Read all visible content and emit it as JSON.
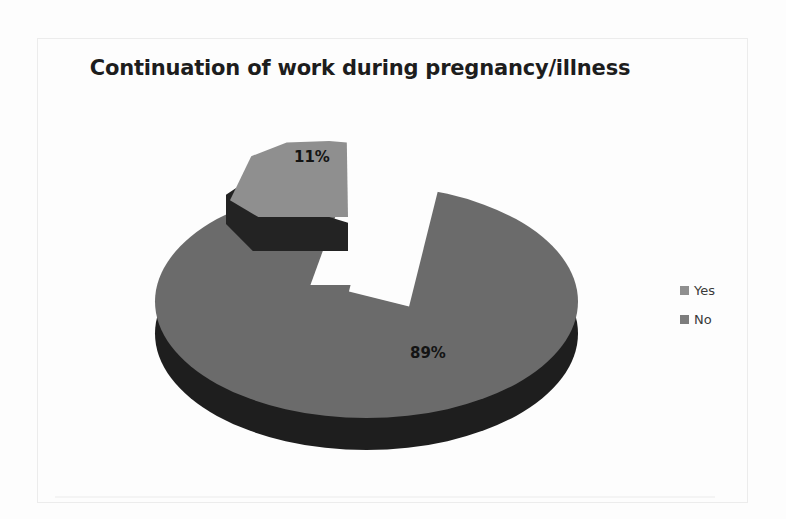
{
  "chart_data": {
    "type": "pie",
    "title": "Continuation of work during pregnancy/illness",
    "categories": [
      "Yes",
      "No"
    ],
    "values": [
      11,
      89
    ],
    "data_labels": [
      "11%",
      "89%"
    ],
    "unit": "percent",
    "legend_position": "right",
    "exploded_slice": "Yes",
    "three_d": true,
    "grid": false,
    "xlabel": "",
    "ylabel": "",
    "colors": {
      "yes_top": "#8f8f8f",
      "yes_side": "#232323",
      "no_top": "#6b6b6b",
      "no_side": "#1e1e1e"
    }
  },
  "title": {
    "text": "Continuation of work during pregnancy/illness"
  },
  "labels": {
    "yes_pct": "11%",
    "no_pct": "89%"
  },
  "legend": {
    "items": [
      {
        "label": "Yes",
        "color": "#8f8f8f"
      },
      {
        "label": "No",
        "color": "#6b6b6b"
      }
    ]
  }
}
